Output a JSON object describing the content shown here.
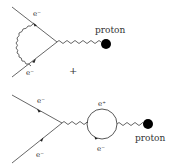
{
  "diagrams": [
    {
      "name": "vertex-correction",
      "electron_in_label": "e⁻",
      "electron_out_label": "e⁻",
      "target_label": "proton"
    },
    {
      "name": "vacuum-polarization",
      "electron_in_label": "e⁻",
      "electron_out_label": "e⁻",
      "loop_top_label": "e⁺",
      "loop_bottom_label": "e⁻",
      "target_label": "proton"
    }
  ],
  "operator": "+",
  "colors": {
    "line": "#444444",
    "blob": "#000000",
    "text": "#333333"
  }
}
